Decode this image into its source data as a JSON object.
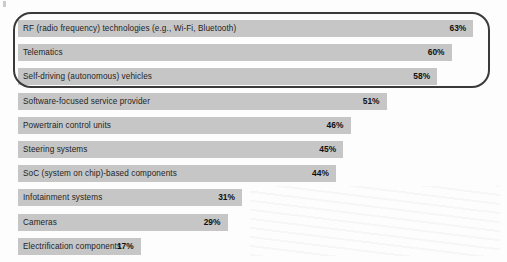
{
  "chart_data": {
    "type": "bar",
    "orientation": "horizontal",
    "title": "",
    "subtitle": "",
    "xlabel": "",
    "ylabel": "",
    "xlim": [
      0,
      70
    ],
    "grid": false,
    "legend": null,
    "value_suffix": "%",
    "categories": [
      "RF (radio frequency) technologies (e.g., Wi-Fi, Bluetooth)",
      "Telematics",
      "Self-driving (autonomous) vehicles",
      "Software-focused service provider",
      "Powertrain control units",
      "Steering systems",
      "SoC (system on chip)-based components",
      "Infotainment systems",
      "Cameras",
      "Electrification components"
    ],
    "values": [
      63,
      60,
      58,
      51,
      46,
      45,
      44,
      31,
      29,
      17
    ],
    "value_labels": [
      "63%",
      "60%",
      "58%",
      "51%",
      "46%",
      "45%",
      "44%",
      "31%",
      "29%",
      "17%"
    ],
    "highlighted_categories": [
      "RF (radio frequency) technologies (e.g., Wi-Fi, Bluetooth)",
      "Telematics",
      "Self-driving (autonomous) vehicles"
    ],
    "bar_color": "#c6c6c6",
    "highlight_outline_color": "#3a3a3a",
    "background_color": "#fdfdfd"
  },
  "rows": [
    {
      "label": "RF (radio frequency) technologies (e.g., Wi-Fi, Bluetooth)",
      "value": 63,
      "value_label": "63%"
    },
    {
      "label": "Telematics",
      "value": 60,
      "value_label": "60%"
    },
    {
      "label": "Self-driving (autonomous) vehicles",
      "value": 58,
      "value_label": "58%"
    },
    {
      "label": "Software-focused service provider",
      "value": 51,
      "value_label": "51%"
    },
    {
      "label": "Powertrain control units",
      "value": 46,
      "value_label": "46%"
    },
    {
      "label": "Steering systems",
      "value": 45,
      "value_label": "45%"
    },
    {
      "label": "SoC (system on chip)-based components",
      "value": 44,
      "value_label": "44%"
    },
    {
      "label": "Infotainment systems",
      "value": 31,
      "value_label": "31%"
    },
    {
      "label": "Cameras",
      "value": 29,
      "value_label": "29%"
    },
    {
      "label": "Electrification components",
      "value": 17,
      "value_label": "17%"
    }
  ]
}
